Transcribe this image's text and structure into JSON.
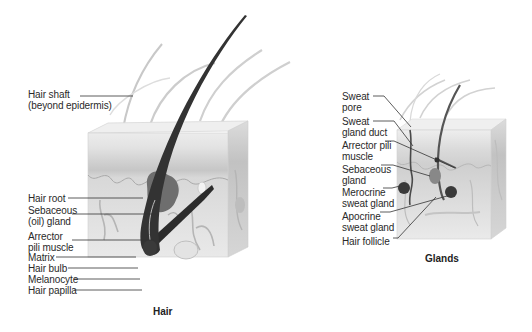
{
  "panels": {
    "hair": {
      "caption": "Hair",
      "labels": [
        {
          "id": "hair-shaft",
          "line1": "Hair shaft",
          "line2": "(beyond epidermis)"
        },
        {
          "id": "hair-root",
          "line1": "Hair root"
        },
        {
          "id": "sebaceous-oil-gland",
          "line1": "Sebaceous",
          "line2": "(oil) gland"
        },
        {
          "id": "arrector-pili-muscle",
          "line1": "Arrector",
          "line2": "pili muscle"
        },
        {
          "id": "matrix",
          "line1": "Matrix"
        },
        {
          "id": "hair-bulb",
          "line1": "Hair bulb"
        },
        {
          "id": "melanocyte",
          "line1": "Melanocyte"
        },
        {
          "id": "hair-papilla",
          "line1": "Hair papilla"
        }
      ]
    },
    "glands": {
      "caption": "Glands",
      "labels": [
        {
          "id": "sweat-pore",
          "line1": "Sweat",
          "line2": "pore"
        },
        {
          "id": "sweat-gland-duct",
          "line1": "Sweat",
          "line2": "gland duct"
        },
        {
          "id": "arrector-pili-muscle",
          "line1": "Arrector pili",
          "line2": "muscle"
        },
        {
          "id": "sebaceous-gland",
          "line1": "Sebaceous",
          "line2": "gland"
        },
        {
          "id": "merocrine-sweat-gland",
          "line1": "Merocrine",
          "line2": "sweat gland"
        },
        {
          "id": "apocrine-sweat-gland",
          "line1": "Apocrine",
          "line2": "sweat gland"
        },
        {
          "id": "hair-follicle",
          "line1": "Hair follicle"
        }
      ]
    }
  },
  "colors": {
    "skin_surface": "#ececec",
    "epidermis": "#d4d4d4",
    "dermis": "#e6e6e6",
    "hair_dark": "#2e2e2e",
    "gland": "#6a6a6a",
    "leader_line": "#333333"
  }
}
